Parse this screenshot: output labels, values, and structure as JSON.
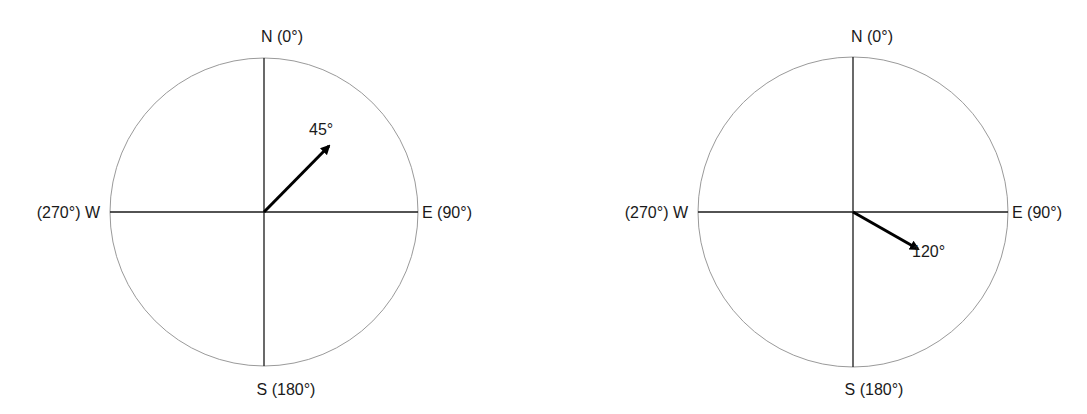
{
  "colors": {
    "circle": "#9a9a9a",
    "axis": "#1a1a1a",
    "arrow": "#000000",
    "text": "#1a1a1a"
  },
  "compasses": [
    {
      "center": [
        264,
        212
      ],
      "radius": 154,
      "labels": {
        "north": "N (0°)",
        "east": "E (90°)",
        "south": "S (180°)",
        "west": "(270°) W"
      },
      "bearing_deg": 45,
      "arrow_length": 95,
      "bearing_label": "45°"
    },
    {
      "center": [
        853,
        212
      ],
      "radius": 155,
      "labels": {
        "north": "N (0°)",
        "east": "E (90°)",
        "south": "S (180°)",
        "west": "(270°) W"
      },
      "bearing_deg": 120,
      "arrow_length": 75,
      "bearing_label": "120°"
    }
  ]
}
